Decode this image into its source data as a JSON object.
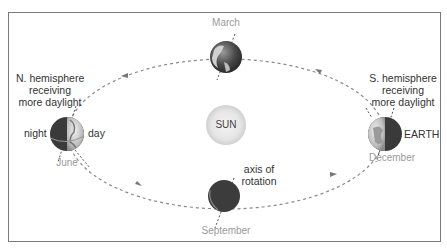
{
  "diagram": {
    "title_fragment": "",
    "sun_label": "SUN",
    "earth_label": "EARTH",
    "months": {
      "top": "March",
      "left": "June",
      "bottom": "September",
      "right": "December"
    },
    "left_annotation": [
      "N. hemisphere",
      "receiving",
      "more daylight"
    ],
    "right_annotation": [
      "S. hemisphere",
      "receiving",
      "more daylight"
    ],
    "night_label": "night",
    "day_label": "day",
    "axis_annotation": [
      "axis of",
      "rotation"
    ],
    "colors": {
      "frame": "#7a7a7a",
      "orbit": "#8a8a8a",
      "month_text": "#9a9a9a",
      "label_text": "#333333",
      "earth_dark": "#3c3c3c",
      "earth_light": "#d8d8d8",
      "sun_fill": "#e8e8e8"
    }
  }
}
